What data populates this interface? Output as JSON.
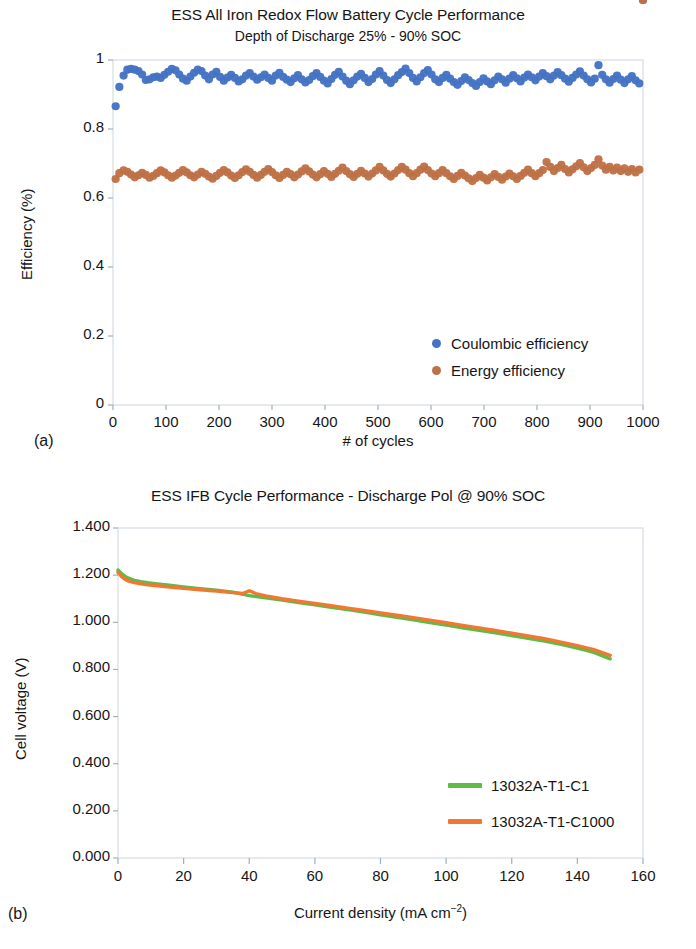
{
  "figure": {
    "panels": [
      {
        "letter": "(a)"
      },
      {
        "letter": "(b)"
      }
    ]
  },
  "chart_data": [
    {
      "id": "panel-a",
      "type": "scatter",
      "title": "ESS All Iron Redox Flow Battery Cycle Performance",
      "subtitle": "Depth of Discharge 25% - 90% SOC",
      "xlabel": "# of cycles",
      "ylabel": "Efficiency (%)",
      "xlim": [
        0,
        1000
      ],
      "ylim": [
        0,
        1
      ],
      "grid": false,
      "legend_position": "inside-bottom-right",
      "xticks": [
        "0",
        "100",
        "200",
        "300",
        "400",
        "500",
        "600",
        "700",
        "800",
        "900",
        "1000"
      ],
      "xtick_values": [
        0,
        100,
        200,
        300,
        400,
        500,
        600,
        700,
        800,
        900,
        1000
      ],
      "yticks": [
        "0",
        "0.2",
        "0.4",
        "0.6",
        "0.8",
        "1"
      ],
      "ytick_values": [
        0,
        0.2,
        0.4,
        0.6,
        0.8,
        1
      ],
      "series": [
        {
          "name": "Coulombic efficiency",
          "color": "#4472c4",
          "marker": "circle",
          "x": [
            5,
            12,
            20,
            27,
            34,
            41,
            48,
            55,
            62,
            69,
            76,
            83,
            90,
            97,
            104,
            111,
            118,
            125,
            132,
            139,
            146,
            153,
            160,
            167,
            174,
            181,
            188,
            195,
            202,
            209,
            216,
            223,
            230,
            237,
            244,
            251,
            258,
            265,
            272,
            279,
            286,
            293,
            300,
            307,
            314,
            321,
            328,
            335,
            342,
            349,
            356,
            363,
            370,
            377,
            384,
            391,
            398,
            405,
            412,
            419,
            426,
            433,
            440,
            447,
            454,
            461,
            468,
            475,
            482,
            489,
            496,
            503,
            510,
            517,
            524,
            531,
            538,
            545,
            552,
            559,
            566,
            573,
            580,
            587,
            594,
            601,
            608,
            615,
            622,
            629,
            636,
            643,
            650,
            657,
            664,
            671,
            678,
            685,
            692,
            699,
            706,
            713,
            720,
            727,
            734,
            741,
            748,
            755,
            762,
            769,
            776,
            783,
            790,
            797,
            804,
            811,
            818,
            825,
            832,
            839,
            846,
            853,
            860,
            867,
            874,
            881,
            888,
            895,
            902,
            909,
            916,
            923,
            930,
            937,
            944,
            951,
            958,
            965,
            972,
            979,
            986,
            993,
            1000
          ],
          "y": [
            0.866,
            0.922,
            0.955,
            0.972,
            0.974,
            0.972,
            0.968,
            0.958,
            0.942,
            0.944,
            0.95,
            0.952,
            0.948,
            0.957,
            0.966,
            0.974,
            0.97,
            0.958,
            0.946,
            0.94,
            0.952,
            0.963,
            0.972,
            0.968,
            0.955,
            0.944,
            0.958,
            0.966,
            0.951,
            0.94,
            0.949,
            0.957,
            0.948,
            0.938,
            0.944,
            0.955,
            0.962,
            0.952,
            0.943,
            0.95,
            0.958,
            0.948,
            0.94,
            0.955,
            0.963,
            0.951,
            0.943,
            0.936,
            0.947,
            0.956,
            0.944,
            0.935,
            0.942,
            0.953,
            0.962,
            0.951,
            0.94,
            0.932,
            0.945,
            0.957,
            0.966,
            0.952,
            0.94,
            0.93,
            0.941,
            0.952,
            0.96,
            0.948,
            0.936,
            0.945,
            0.958,
            0.968,
            0.955,
            0.942,
            0.933,
            0.944,
            0.956,
            0.965,
            0.975,
            0.962,
            0.948,
            0.938,
            0.95,
            0.962,
            0.971,
            0.958,
            0.944,
            0.936,
            0.948,
            0.957,
            0.946,
            0.936,
            0.928,
            0.939,
            0.95,
            0.942,
            0.933,
            0.925,
            0.936,
            0.947,
            0.938,
            0.93,
            0.941,
            0.952,
            0.944,
            0.934,
            0.946,
            0.956,
            0.947,
            0.938,
            0.949,
            0.958,
            0.95,
            0.941,
            0.952,
            0.962,
            0.953,
            0.944,
            0.955,
            0.965,
            0.956,
            0.946,
            0.937,
            0.948,
            0.958,
            0.967,
            0.955,
            0.944,
            0.935,
            0.946,
            0.985,
            0.957,
            0.944,
            0.934,
            0.945,
            0.955,
            0.943,
            0.933,
            0.944,
            0.953,
            0.941,
            0.932
          ]
        },
        {
          "name": "Energy efficiency",
          "color": "#be7046",
          "marker": "circle",
          "x": [
            5,
            12,
            20,
            27,
            34,
            41,
            48,
            55,
            62,
            69,
            76,
            83,
            90,
            97,
            104,
            111,
            118,
            125,
            132,
            139,
            146,
            153,
            160,
            167,
            174,
            181,
            188,
            195,
            202,
            209,
            216,
            223,
            230,
            237,
            244,
            251,
            258,
            265,
            272,
            279,
            286,
            293,
            300,
            307,
            314,
            321,
            328,
            335,
            342,
            349,
            356,
            363,
            370,
            377,
            384,
            391,
            398,
            405,
            412,
            419,
            426,
            433,
            440,
            447,
            454,
            461,
            468,
            475,
            482,
            489,
            496,
            503,
            510,
            517,
            524,
            531,
            538,
            545,
            552,
            559,
            566,
            573,
            580,
            587,
            594,
            601,
            608,
            615,
            622,
            629,
            636,
            643,
            650,
            657,
            664,
            671,
            678,
            685,
            692,
            699,
            706,
            713,
            720,
            727,
            734,
            741,
            748,
            755,
            762,
            769,
            776,
            783,
            790,
            797,
            804,
            811,
            818,
            825,
            832,
            839,
            846,
            853,
            860,
            867,
            874,
            881,
            888,
            895,
            902,
            909,
            916,
            923,
            930,
            937,
            944,
            951,
            958,
            965,
            972,
            979,
            986,
            993,
            1000
          ],
          "y": [
            0.655,
            0.672,
            0.68,
            0.676,
            0.668,
            0.66,
            0.666,
            0.673,
            0.667,
            0.659,
            0.664,
            0.672,
            0.68,
            0.674,
            0.666,
            0.659,
            0.665,
            0.673,
            0.681,
            0.674,
            0.666,
            0.66,
            0.668,
            0.676,
            0.67,
            0.662,
            0.656,
            0.664,
            0.673,
            0.681,
            0.674,
            0.665,
            0.658,
            0.666,
            0.675,
            0.683,
            0.676,
            0.667,
            0.659,
            0.667,
            0.676,
            0.684,
            0.675,
            0.666,
            0.658,
            0.667,
            0.676,
            0.669,
            0.66,
            0.668,
            0.677,
            0.686,
            0.677,
            0.668,
            0.66,
            0.669,
            0.678,
            0.67,
            0.661,
            0.67,
            0.679,
            0.688,
            0.678,
            0.669,
            0.661,
            0.67,
            0.679,
            0.671,
            0.662,
            0.671,
            0.68,
            0.69,
            0.68,
            0.67,
            0.662,
            0.671,
            0.681,
            0.69,
            0.682,
            0.672,
            0.663,
            0.672,
            0.682,
            0.691,
            0.681,
            0.671,
            0.663,
            0.672,
            0.681,
            0.672,
            0.663,
            0.655,
            0.664,
            0.673,
            0.665,
            0.657,
            0.649,
            0.658,
            0.667,
            0.659,
            0.651,
            0.66,
            0.669,
            0.661,
            0.653,
            0.662,
            0.671,
            0.663,
            0.655,
            0.664,
            0.673,
            0.682,
            0.672,
            0.663,
            0.672,
            0.681,
            0.704,
            0.69,
            0.678,
            0.687,
            0.696,
            0.684,
            0.674,
            0.683,
            0.692,
            0.701,
            0.689,
            0.678,
            0.687,
            0.696,
            0.712,
            0.694,
            0.682,
            0.69,
            0.68,
            0.688,
            0.678,
            0.686,
            0.676,
            0.684,
            0.674,
            0.682
          ]
        }
      ]
    },
    {
      "id": "panel-b",
      "type": "line",
      "title": "ESS IFB Cycle Performance - Discharge Pol @ 90% SOC",
      "xlabel": "Current density (mA cm−2)",
      "ylabel": "Cell voltage (V)",
      "xlim": [
        0,
        160
      ],
      "ylim": [
        0,
        1.4
      ],
      "grid": false,
      "legend_position": "inside-bottom-right",
      "xticks": [
        "0",
        "20",
        "40",
        "60",
        "80",
        "100",
        "120",
        "140",
        "160"
      ],
      "xtick_values": [
        0,
        20,
        40,
        60,
        80,
        100,
        120,
        140,
        160
      ],
      "yticks": [
        "0.000",
        "0.200",
        "0.400",
        "0.600",
        "0.800",
        "1.000",
        "1.200",
        "1.400"
      ],
      "ytick_values": [
        0,
        0.2,
        0.4,
        0.6,
        0.8,
        1.0,
        1.2,
        1.4
      ],
      "series": [
        {
          "name": "13032A-T1-C1",
          "color": "#5fbb46",
          "x": [
            0,
            1,
            2,
            3,
            5,
            7,
            9,
            12,
            15,
            20,
            25,
            30,
            35,
            40,
            45,
            50,
            55,
            60,
            65,
            70,
            75,
            80,
            85,
            90,
            95,
            100,
            105,
            110,
            115,
            120,
            125,
            130,
            135,
            140,
            145,
            150
          ],
          "y": [
            1.222,
            1.208,
            1.196,
            1.188,
            1.178,
            1.172,
            1.168,
            1.163,
            1.158,
            1.15,
            1.143,
            1.136,
            1.128,
            1.113,
            1.104,
            1.094,
            1.084,
            1.074,
            1.064,
            1.054,
            1.043,
            1.032,
            1.021,
            1.01,
            0.999,
            0.988,
            0.977,
            0.966,
            0.955,
            0.944,
            0.932,
            0.92,
            0.906,
            0.89,
            0.872,
            0.845
          ]
        },
        {
          "name": "13032A-T1-C1000",
          "color": "#f07832",
          "x": [
            0,
            1,
            2,
            3,
            5,
            7,
            9,
            12,
            15,
            20,
            25,
            30,
            35,
            38,
            40,
            42,
            45,
            50,
            55,
            60,
            65,
            70,
            75,
            80,
            85,
            90,
            95,
            100,
            105,
            110,
            115,
            120,
            125,
            130,
            135,
            140,
            145,
            150
          ],
          "y": [
            1.212,
            1.196,
            1.184,
            1.176,
            1.168,
            1.163,
            1.159,
            1.155,
            1.151,
            1.144,
            1.138,
            1.132,
            1.126,
            1.122,
            1.134,
            1.122,
            1.112,
            1.1,
            1.09,
            1.08,
            1.07,
            1.06,
            1.05,
            1.04,
            1.03,
            1.02,
            1.009,
            0.998,
            0.987,
            0.976,
            0.965,
            0.954,
            0.942,
            0.93,
            0.916,
            0.901,
            0.884,
            0.86
          ]
        }
      ]
    }
  ]
}
